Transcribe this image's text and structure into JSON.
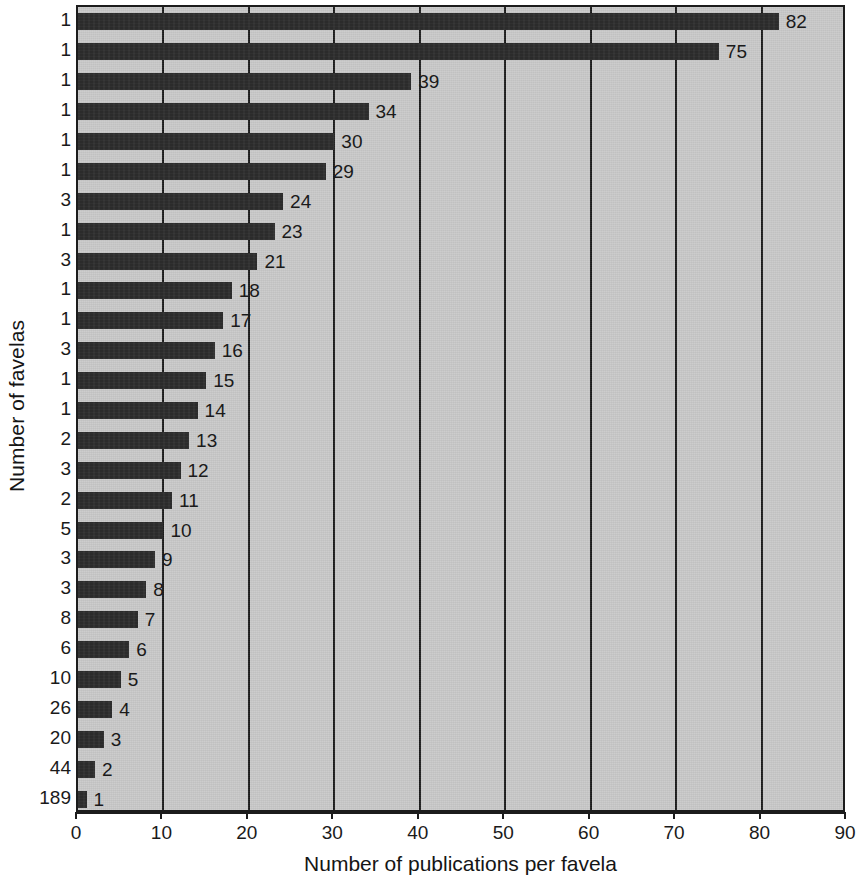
{
  "chart_data": {
    "type": "bar",
    "orientation": "horizontal",
    "title": "",
    "xlabel": "Number of publications per favela",
    "ylabel": "Number of favelas",
    "xlim": [
      0,
      90
    ],
    "xticks": [
      0,
      10,
      20,
      30,
      40,
      50,
      60,
      70,
      80,
      90
    ],
    "grid": "vertical",
    "legend": null,
    "categories": [
      "1",
      "1",
      "1",
      "1",
      "1",
      "1",
      "3",
      "1",
      "3",
      "1",
      "1",
      "3",
      "1",
      "1",
      "2",
      "3",
      "2",
      "5",
      "3",
      "3",
      "8",
      "6",
      "10",
      "26",
      "20",
      "44",
      "189"
    ],
    "values": [
      82,
      75,
      39,
      34,
      30,
      29,
      24,
      23,
      21,
      18,
      17,
      16,
      15,
      14,
      13,
      12,
      11,
      10,
      9,
      8,
      7,
      6,
      5,
      4,
      3,
      2,
      1
    ],
    "bar_labels": [
      "82",
      "75",
      "39",
      "34",
      "30",
      "29",
      "24",
      "23",
      "21",
      "18",
      "17",
      "16",
      "15",
      "14",
      "13",
      "12",
      "11",
      "10",
      "9",
      "8",
      "7",
      "6",
      "5",
      "4",
      "3",
      "2",
      "1"
    ],
    "colors": {
      "bar": "#2b2b2b",
      "plot_background": "#c9c9c9",
      "axis": "#1c1c1c",
      "text": "#1a1a1a"
    }
  }
}
